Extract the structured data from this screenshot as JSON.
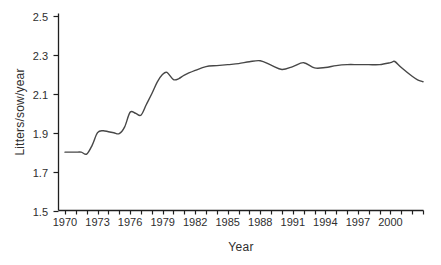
{
  "figure": {
    "background": "#ffffff",
    "axis_color": "#1f1f1f",
    "text_color": "#2e2e2e"
  },
  "chart_data": {
    "type": "line",
    "title": "",
    "xlabel": "Year",
    "ylabel": "Litters/sow/year",
    "xlim": [
      1969.4,
      2003.1
    ],
    "ylim": [
      1.5,
      2.5
    ],
    "grid": false,
    "legend": "none",
    "line_color": "#474747",
    "y_ticks": [
      1.5,
      1.7,
      1.9,
      2.1,
      2.3,
      2.5
    ],
    "y_tick_labels": [
      "1.5",
      "1.7",
      "1.9",
      "2.1",
      "2.3",
      "2.5"
    ],
    "x_tick_start": 1970,
    "x_tick_end": 2003,
    "x_minor_tick_every": 1,
    "x_labeled_ticks": [
      1970,
      1973,
      1976,
      1979,
      1982,
      1985,
      1988,
      1991,
      1994,
      1997,
      2000
    ],
    "series": [
      {
        "name": "Litters/sow/year",
        "x": [
          1970,
          1970.5,
          1971,
          1971.5,
          1972,
          1972.5,
          1973,
          1973.5,
          1974,
          1974.5,
          1975,
          1975.5,
          1976,
          1976.5,
          1977,
          1977.5,
          1978,
          1978.5,
          1979,
          1979.4,
          1980,
          1980.5,
          1981,
          1982,
          1983,
          1984,
          1985,
          1986,
          1987,
          1988,
          1989,
          1990,
          1991,
          1992,
          1993,
          1994,
          1995,
          1996,
          1997,
          1998,
          1999,
          2000,
          2000.4,
          2001,
          2002,
          2002.5,
          2003
        ],
        "y": [
          1.8,
          1.8,
          1.8,
          1.8,
          1.79,
          1.835,
          1.9,
          1.91,
          1.905,
          1.9,
          1.895,
          1.93,
          2.005,
          2.0,
          1.99,
          2.045,
          2.1,
          2.16,
          2.2,
          2.21,
          2.173,
          2.178,
          2.196,
          2.22,
          2.24,
          2.245,
          2.25,
          2.255,
          2.265,
          2.27,
          2.247,
          2.225,
          2.24,
          2.26,
          2.233,
          2.235,
          2.245,
          2.25,
          2.25,
          2.25,
          2.25,
          2.26,
          2.266,
          2.235,
          2.19,
          2.172,
          2.162
        ]
      }
    ]
  }
}
